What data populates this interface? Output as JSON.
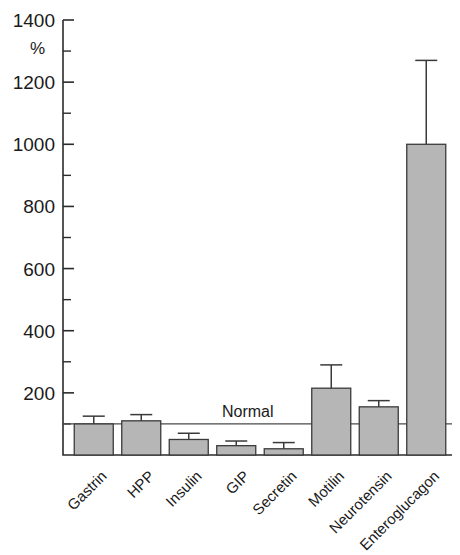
{
  "chart_data": {
    "type": "bar",
    "title": "",
    "subtitle": "",
    "xlabel": "",
    "ylabel": "%",
    "ylim": [
      0,
      1400
    ],
    "ytick_step": 200,
    "yminor_step": 100,
    "grid": false,
    "legend": null,
    "categories": [
      "Gastrin",
      "HPP",
      "Insulin",
      "GIP",
      "Secretin",
      "Motilin",
      "Neurotensin",
      "Enteroglucagon"
    ],
    "values": [
      100,
      110,
      50,
      30,
      20,
      215,
      155,
      1000
    ],
    "errors_upper": [
      125,
      130,
      70,
      45,
      40,
      290,
      175,
      1270
    ],
    "ytick_labels": [
      "1400",
      "1200",
      "1000",
      "800",
      "600",
      "400",
      "200"
    ],
    "ytick_values": [
      1400,
      1200,
      1000,
      800,
      600,
      400,
      200
    ],
    "yminor_values": [
      1300,
      1100,
      900,
      700,
      500,
      300,
      100
    ],
    "reference_line": {
      "label": "Normal",
      "value": 100
    },
    "series": [
      {
        "name": "Percent of normal",
        "values": [
          100,
          110,
          50,
          30,
          20,
          215,
          155,
          1000
        ],
        "errors_upper": [
          125,
          130,
          70,
          45,
          40,
          290,
          175,
          1270
        ]
      }
    ],
    "bar_fill_color": "#b6b6b6",
    "bar_stroke_color": "#3a3a3a",
    "axis_color": "#2b2b2b",
    "label_rotation_deg": -45
  }
}
